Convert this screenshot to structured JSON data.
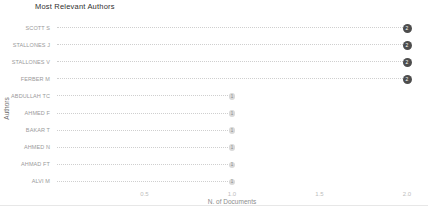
{
  "page": {
    "title": "Most Relevant Authors"
  },
  "colors": {
    "dot_filled": "#4d4d4d",
    "dot_filled_text": "#ffffff",
    "dot_light": "#d9d9d9",
    "dot_light_text": "#8c8c8c",
    "stem": "#cfcfcf",
    "tick_text": "#bdbdbd",
    "axis_text": "#8c8c8c",
    "category_text": "#9a9a9a",
    "title_text": "#2f2f2f",
    "background": "#ffffff"
  },
  "chart_data": {
    "type": "bar",
    "style": "horizontal-lollipop",
    "title": "Most Relevant Authors",
    "xlabel": "N. of Documents",
    "ylabel": "Authors",
    "categories": [
      "SCOTT S",
      "STALLONES J",
      "STALLONES V",
      "FERBER M",
      "ABDULLAH TC",
      "AHMED F",
      "BAKAR T",
      "AHMED N",
      "AHMAD FT",
      "ALVI M"
    ],
    "values": [
      2,
      2,
      2,
      2,
      1,
      1,
      1,
      1,
      1,
      1
    ],
    "value_labels": [
      "2",
      "2",
      "2",
      "2",
      "1",
      "1",
      "1",
      "1",
      "1",
      "1"
    ],
    "xlim": [
      0,
      2.1
    ],
    "xticks": [
      0.5,
      1.0,
      1.5,
      2.0
    ],
    "xtick_labels": [
      "0.5",
      "1.0",
      "1.5",
      "2.0"
    ],
    "grid": false,
    "legend": false
  }
}
